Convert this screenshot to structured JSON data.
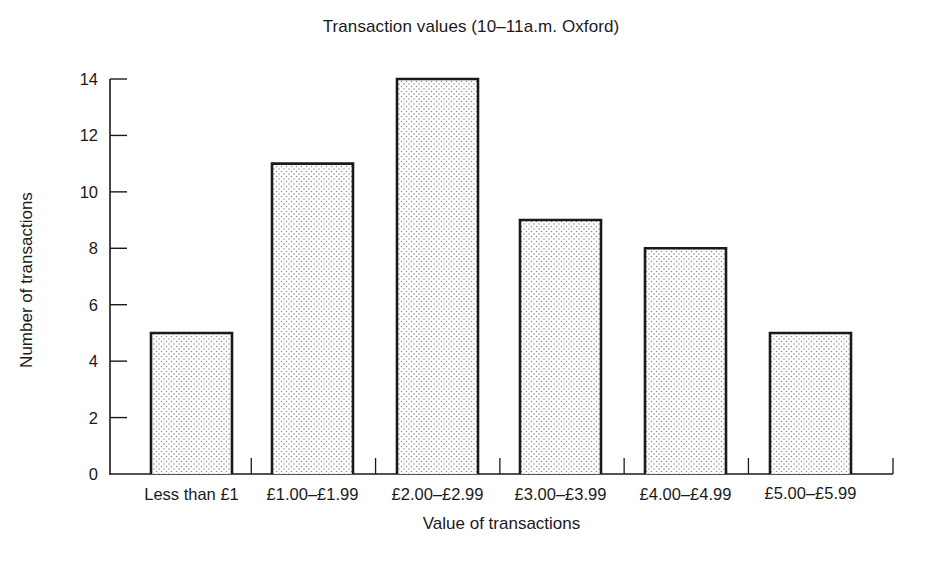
{
  "chart_data": {
    "type": "bar",
    "title": "Transaction values (10–11a.m. Oxford)",
    "xlabel": "Value of transactions",
    "ylabel": "Number of transactions",
    "categories": [
      "Less than £1",
      "£1.00–£1.99",
      "£2.00–£2.99",
      "£3.00–£3.99",
      "£4.00–£4.99",
      "£5.00–£5.99"
    ],
    "values": [
      5,
      11,
      14,
      9,
      8,
      5
    ],
    "ylim": [
      0,
      14
    ],
    "yticks": [
      0,
      2,
      4,
      6,
      8,
      10,
      12,
      14
    ],
    "grid": false,
    "legend": null,
    "bar_fill": "dotted stipple pattern",
    "colors": {
      "bar_outline": "#1a1a1a",
      "bar_dot": "#8a8a8a",
      "axis": "#1a1a1a",
      "background": "#ffffff"
    }
  }
}
